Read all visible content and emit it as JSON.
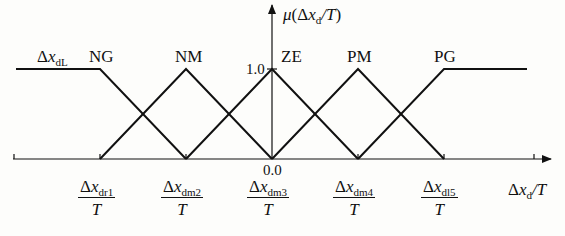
{
  "diagram": {
    "type": "fuzzy-membership-functions",
    "y_axis_label": {
      "prefix": "μ(Δ",
      "var": "x",
      "sub": "d",
      "suffix": "/T)"
    },
    "x_axis_label": {
      "prefix": "Δ",
      "var": "x",
      "sub": "d",
      "suffix": "/T"
    },
    "y_value_top": "1.0",
    "origin_value": "0.0",
    "left_limit_label": {
      "prefix": "Δ",
      "var": "x",
      "sub": "dL"
    },
    "sets": [
      {
        "name": "NG",
        "shape": "left-shoulder"
      },
      {
        "name": "NM",
        "shape": "triangle"
      },
      {
        "name": "ZE",
        "shape": "triangle"
      },
      {
        "name": "PM",
        "shape": "triangle"
      },
      {
        "name": "PG",
        "shape": "right-shoulder"
      }
    ],
    "ticks": [
      {
        "num_prefix": "Δ",
        "var": "x",
        "sub": "dr1",
        "den": "T"
      },
      {
        "num_prefix": "Δ",
        "var": "x",
        "sub": "dm2",
        "den": "T"
      },
      {
        "num_prefix": "Δ",
        "var": "x",
        "sub": "dm3",
        "den": "T"
      },
      {
        "num_prefix": "Δ",
        "var": "x",
        "sub": "dm4",
        "den": "T"
      },
      {
        "num_prefix": "Δ",
        "var": "x",
        "sub": "dl5",
        "den": "T"
      }
    ],
    "line_color": "#111111"
  }
}
